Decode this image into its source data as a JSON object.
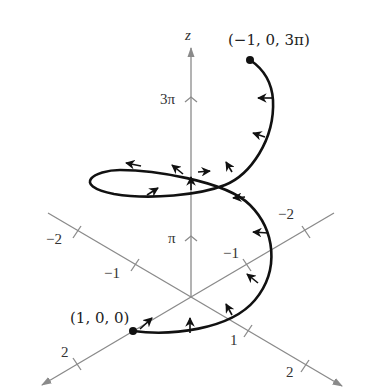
{
  "figure": {
    "axes": {
      "z": {
        "label": "z",
        "ticks": [
          {
            "label": "π",
            "value": "π"
          },
          {
            "label": "3π",
            "value": "3π"
          }
        ]
      },
      "x": {
        "label": "x",
        "ticks": [
          {
            "label": "2"
          },
          {
            "label": "−1"
          },
          {
            "label": "−2"
          }
        ]
      },
      "y": {
        "label": "y",
        "ticks": [
          {
            "label": "1"
          },
          {
            "label": "2"
          },
          {
            "label": "−1"
          },
          {
            "label": "−2"
          }
        ]
      }
    },
    "points": {
      "start": {
        "label": "(1, 0, 0)"
      },
      "end": {
        "label": "(−1, 0, 3π)"
      }
    },
    "colors": {
      "axis": "#8a8a8a",
      "curve": "#111111",
      "background": "#ffffff"
    }
  }
}
